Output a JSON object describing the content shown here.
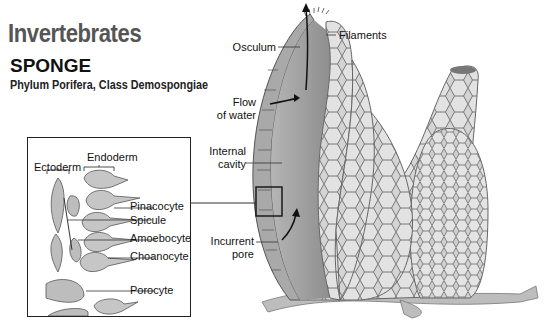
{
  "header": {
    "title": "Invertebrates",
    "subtitle": "SPONGE",
    "classification": "Phylum Porifera, Class Demospongiae"
  },
  "inset": {
    "layer_labels": [
      "Ectoderm",
      "Endoderm"
    ],
    "cell_labels": [
      "Pinacocyte",
      "Spicule",
      "Amoebocyte",
      "Choanocyte",
      "Porocyte"
    ]
  },
  "sponge_labels": {
    "filaments": "Filaments",
    "osculum": "Osculum",
    "flow_line1": "Flow",
    "flow_line2": "of water",
    "cavity_line1": "Internal",
    "cavity_line2": "cavity",
    "pore_line1": "Incurrent",
    "pore_line2": "pore"
  },
  "colors": {
    "title_gray": "#555555",
    "sponge_fill": "#c9c9c9",
    "cell_outline": "#6a6a6a",
    "cavity": "#9a9a9a"
  }
}
